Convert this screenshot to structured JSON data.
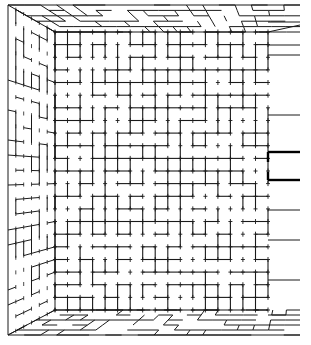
{
  "diagram": {
    "kind": "3D maze room interior (one-point perspective)",
    "colors": {
      "background": "#ffffff",
      "line": "#1a1a1a",
      "accent_line": "#000000"
    },
    "outer_frame": {
      "x0": 8,
      "y0": 5,
      "x1": 300,
      "y1": 335
    },
    "back_wall": {
      "x0": 55,
      "y0": 32,
      "x1": 268,
      "y1": 310
    },
    "grid": {
      "cols": 17,
      "rows": 22
    },
    "right_openings": [
      {
        "y": 152,
        "label": ""
      },
      {
        "y": 180,
        "label": ""
      }
    ],
    "right_wall_lines_y": [
      22,
      45,
      55,
      115,
      210,
      240,
      280,
      315
    ]
  }
}
